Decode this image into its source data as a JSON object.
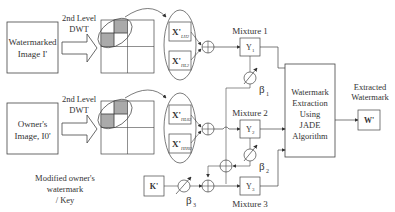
{
  "diagram": {
    "inputs": [
      {
        "label_line1": "Watermarked",
        "label_line2": "Image I'"
      },
      {
        "label_line1": "Owner's",
        "label_line2": "Image, I0'"
      }
    ],
    "dwt_label_line1": "2nd Level",
    "dwt_label_line2": "DWT",
    "subbands_top": [
      {
        "symbol": "X'",
        "sub": "LH2"
      },
      {
        "symbol": "X'",
        "sub": "HL2"
      }
    ],
    "subbands_bottom": [
      {
        "symbol": "X'",
        "sub": "HL02"
      },
      {
        "symbol": "X'",
        "sub": "HH02"
      }
    ],
    "mixtures": [
      {
        "title": "Mixture 1",
        "symbol": "Y",
        "sub": "1",
        "beta": "β",
        "beta_sub": "1"
      },
      {
        "title": "Mixture 2",
        "symbol": "Y",
        "sub": "2",
        "beta": "β",
        "beta_sub": "2"
      },
      {
        "title": "Mixture 3",
        "symbol": "Y",
        "sub": "3",
        "beta": "β",
        "beta_sub": "3"
      }
    ],
    "key": {
      "symbol": "K'",
      "label_line1": "Modified owner's",
      "label_line2": "watermark",
      "label_line3": "/ Key"
    },
    "extraction": {
      "line1": "Watermark",
      "line2": "Extraction",
      "line3": "Using",
      "line4": "JADE",
      "line5": "Algorithm"
    },
    "output": {
      "title_line1": "Extracted",
      "title_line2": "Watermark",
      "symbol": "W'"
    },
    "sum_symbol": "⊕"
  }
}
